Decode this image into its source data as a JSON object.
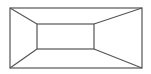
{
  "diagram": {
    "type": "perspective-frame",
    "stroke_color": "#555555",
    "background": "#ffffff",
    "outer_rect": {
      "x1": 10,
      "y1": 8,
      "x2": 142,
      "y2": 68
    },
    "inner_rect": {
      "x1": 37,
      "y1": 24,
      "x2": 94,
      "y2": 49
    }
  }
}
